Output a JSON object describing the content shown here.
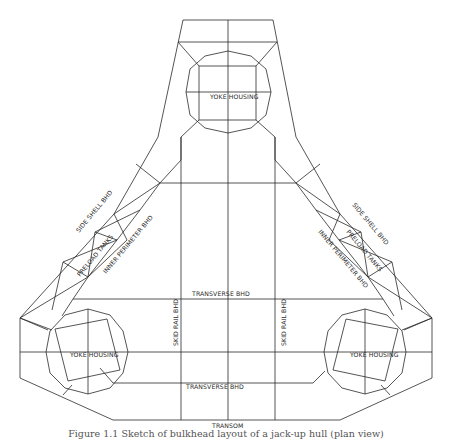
{
  "diagram": {
    "type": "structural-plan",
    "labels": {
      "yoke_top": "YOKE HOUSING",
      "yoke_left": "YOKE HOUSING",
      "yoke_right": "YOKE HOUSING",
      "side_shell_left": "SIDE SHELL BHD",
      "side_shell_right": "SIDE SHELL BHD",
      "preload_left": "PRELOAD TANKS",
      "preload_right": "PRELOAD TANKS",
      "inner_perimeter_left": "INNER PERIMETER BHD",
      "inner_perimeter_right": "INNER PERIMETER BHD",
      "transverse_top": "TRANSVERSE BHD",
      "transverse_bottom": "TRANSVERSE BHD",
      "skid_rail_left": "SKID RAIL BHD",
      "skid_rail_right": "SKID RAIL BHD",
      "transom": "TRANSOM"
    },
    "line_color": "#2a2a2a"
  },
  "caption": "Figure 1.1 Sketch of bulkhead layout of a jack-up hull (plan view)"
}
